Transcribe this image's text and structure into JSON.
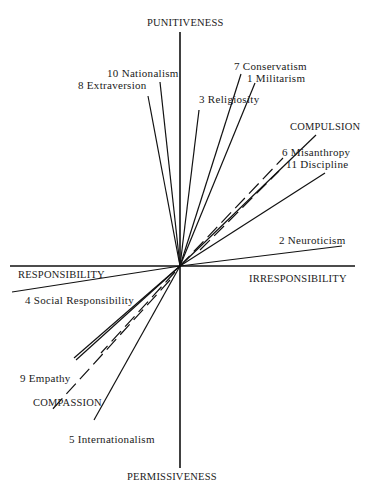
{
  "axes": {
    "top": "PUNITIVENESS",
    "bottom": "PERMISSIVENESS",
    "left": "RESPONSIBILITY",
    "right": "IRRESPONSIBILITY",
    "compulsion": "COMPULSION",
    "compassion": "COMPASSION"
  },
  "variables": [
    {
      "id": 1,
      "label": "1 Militarism"
    },
    {
      "id": 2,
      "label": "2 Neuroticism"
    },
    {
      "id": 3,
      "label": "3 Religiosity"
    },
    {
      "id": 4,
      "label": "4 Social Responsibility"
    },
    {
      "id": 5,
      "label": "5 Internationalism"
    },
    {
      "id": 6,
      "label": "6 Misanthropy"
    },
    {
      "id": 7,
      "label": "7 Conservatism"
    },
    {
      "id": 8,
      "label": "8 Extraversion"
    },
    {
      "id": 9,
      "label": "9 Empathy"
    },
    {
      "id": 10,
      "label": "10 Nationalism"
    },
    {
      "id": 11,
      "label": "11 Discipline"
    }
  ],
  "colors": {
    "ink": "#111111",
    "background": "#ffffff"
  }
}
